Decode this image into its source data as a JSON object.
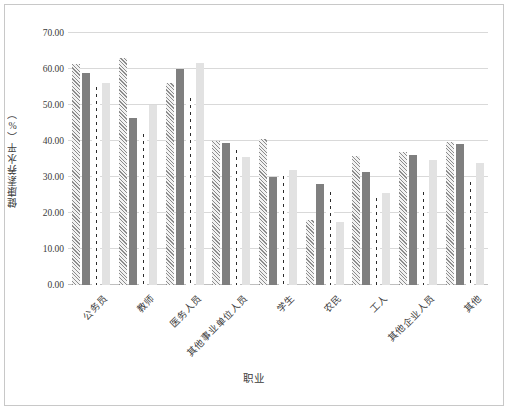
{
  "chart_data": {
    "type": "bar",
    "title": "",
    "xlabel": "职业",
    "ylabel": "健康素养水平（%）",
    "ylim": [
      0,
      70
    ],
    "ytick_labels": [
      "70.00",
      "60.00",
      "50.00",
      "40.00",
      "30.00",
      "20.00",
      "10.00",
      "0.00"
    ],
    "ytick_values": [
      70,
      60,
      50,
      40,
      30,
      20,
      10,
      0
    ],
    "grid": true,
    "legend": "none",
    "categories": [
      "公务员",
      "教师",
      "医务人员",
      "其他事业单位人员",
      "学生",
      "农民",
      "工人",
      "其他企业人员",
      "其他"
    ],
    "series": [
      {
        "name": "series-1",
        "style": "diagonal-hatch",
        "color": "#8c8c8c",
        "values": [
          61.5,
          63.0,
          56.0,
          40.0,
          40.5,
          18.0,
          35.8,
          37.0,
          39.8
        ]
      },
      {
        "name": "series-2",
        "style": "solid-dark-gray",
        "color": "#7f7f7f",
        "values": [
          59.0,
          46.5,
          60.0,
          39.5,
          30.0,
          28.0,
          31.5,
          36.0,
          39.3
        ]
      },
      {
        "name": "series-3",
        "style": "dotted",
        "color": "#2b2b2b",
        "values": [
          56.0,
          43.0,
          53.0,
          38.5,
          31.5,
          27.0,
          25.2,
          27.0,
          29.8
        ]
      },
      {
        "name": "series-4",
        "style": "solid-light-gray",
        "color": "#e2e2e2",
        "values": [
          56.0,
          50.0,
          61.8,
          35.5,
          32.0,
          17.5,
          25.5,
          34.8,
          34.0
        ]
      }
    ]
  }
}
